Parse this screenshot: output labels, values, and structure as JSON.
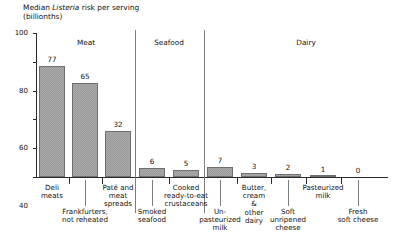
{
  "title": {
    "line1_before": "Median ",
    "line1_italic": "Listeria",
    "line1_after": " risk per serving",
    "line2": "(billionths)"
  },
  "axis": {
    "y_ticks": [
      "0",
      "20",
      "40",
      "60",
      "80",
      "100"
    ]
  },
  "sections": [
    {
      "name": "Meat"
    },
    {
      "name": "Seafood"
    },
    {
      "name": "Dairy"
    }
  ],
  "bars": [
    {
      "label": "Deli\nmeats",
      "value": "77"
    },
    {
      "label": "Frankfurters,\nnot reheated",
      "value": "65"
    },
    {
      "label": "Paté and\nmeat\nspreads",
      "value": "32"
    },
    {
      "label": "Smoked\nseafood",
      "value": "6"
    },
    {
      "label": "Cooked\nready-to-eat\ncrustaceans",
      "value": "5"
    },
    {
      "label": "Un-\npasteurized\nmilk",
      "value": "7"
    },
    {
      "label": "Butter,\ncream\n&\nother\ndairy",
      "value": "3"
    },
    {
      "label": "Soft\nunripened\ncheese",
      "value": "2"
    },
    {
      "label": "Pasteurized\nmilk",
      "value": "1"
    },
    {
      "label": "Fresh\nsoft cheese",
      "value": "0"
    }
  ],
  "chart_data": {
    "type": "bar",
    "title": "Median Listeria risk per serving (billionths)",
    "xlabel": "",
    "ylabel": "Median Listeria risk per serving (billionths)",
    "ylim": [
      0,
      100
    ],
    "yticks": [
      0,
      20,
      40,
      60,
      80,
      100
    ],
    "grid": false,
    "legend": "none",
    "categories": [
      "Deli meats",
      "Frankfurters, not reheated",
      "Paté and meat spreads",
      "Smoked seafood",
      "Cooked ready-to-eat crustaceans",
      "Un-pasteurized milk",
      "Butter, cream & other dairy",
      "Soft unripened cheese",
      "Pasteurized milk",
      "Fresh soft cheese"
    ],
    "values": [
      77,
      65,
      32,
      6,
      5,
      7,
      3,
      2,
      1,
      0
    ],
    "groups": [
      {
        "name": "Meat",
        "categories": [
          "Deli meats",
          "Frankfurters, not reheated",
          "Paté and meat spreads"
        ],
        "values": [
          77,
          65,
          32
        ]
      },
      {
        "name": "Seafood",
        "categories": [
          "Smoked seafood",
          "Cooked ready-to-eat crustaceans"
        ],
        "values": [
          6,
          5
        ]
      },
      {
        "name": "Dairy",
        "categories": [
          "Un-pasteurized milk",
          "Butter, cream & other dairy",
          "Soft unripened cheese",
          "Pasteurized milk",
          "Fresh soft cheese"
        ],
        "values": [
          7,
          3,
          2,
          1,
          0
        ]
      }
    ],
    "bar_color": "#9a9a9a"
  }
}
